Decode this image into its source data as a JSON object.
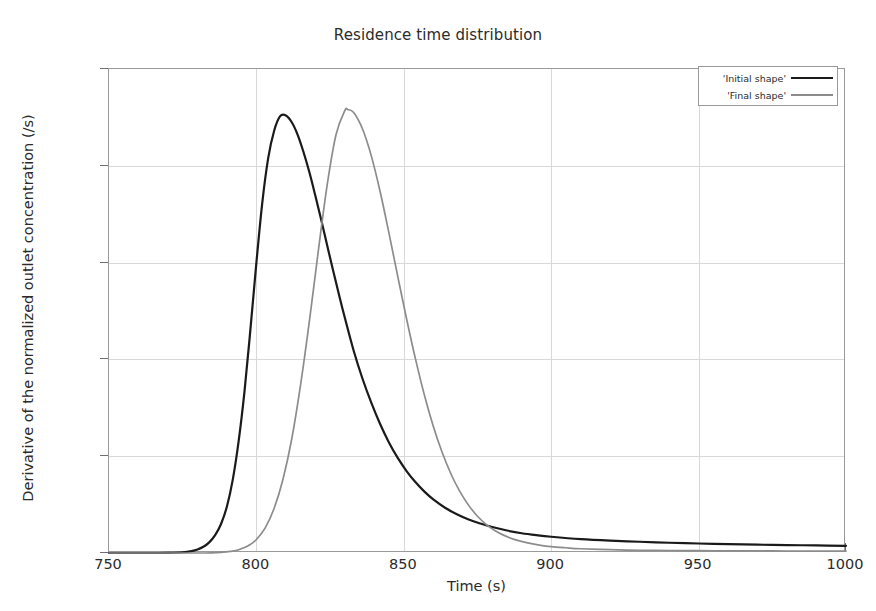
{
  "chart_data": {
    "type": "line",
    "title": "Residence time distribution",
    "xlabel": "Time (s)",
    "ylabel": "Derivative of the normalized outlet concentration (/s)",
    "xlim": [
      750,
      1000
    ],
    "ylim": [
      0,
      0.025
    ],
    "xticks": [
      750,
      800,
      850,
      900,
      950,
      1000
    ],
    "xticklabels": [
      "750",
      "800",
      "850",
      "900",
      "950",
      "1000"
    ],
    "yticks": [
      0,
      0.005,
      0.01,
      0.015,
      0.02,
      0.025
    ],
    "yticklabels": [
      "0",
      "0.005",
      "0.01",
      "0.015",
      "0.02",
      "0.025"
    ],
    "grid": true,
    "legend_position": "top-right",
    "series": [
      {
        "name": "'Initial shape'",
        "color": "#1a1a1a",
        "peak_x": 808,
        "peak_y": 0.0226,
        "x": [
          750,
          755,
          760,
          765,
          770,
          775,
          778,
          780,
          782,
          784,
          786,
          788,
          790,
          792,
          794,
          796,
          798,
          800,
          802,
          804,
          806,
          808,
          810,
          812,
          814,
          816,
          818,
          820,
          822,
          824,
          826,
          828,
          830,
          833,
          836,
          839,
          842,
          845,
          848,
          851,
          854,
          857,
          860,
          864,
          868,
          872,
          876,
          880,
          885,
          890,
          895,
          900,
          910,
          920,
          930,
          940,
          950,
          960,
          970,
          980,
          990,
          1000
        ],
        "y": [
          0.0,
          0.0,
          0.0,
          0.0,
          1e-05,
          4e-05,
          0.0001,
          0.00018,
          0.00032,
          0.00055,
          0.00092,
          0.0015,
          0.0024,
          0.0038,
          0.0058,
          0.0084,
          0.0116,
          0.015,
          0.0181,
          0.0204,
          0.0218,
          0.02255,
          0.0226,
          0.02225,
          0.0216,
          0.0207,
          0.01965,
          0.01845,
          0.0172,
          0.0159,
          0.0146,
          0.01335,
          0.01215,
          0.01045,
          0.009,
          0.00775,
          0.00665,
          0.0057,
          0.0049,
          0.00422,
          0.00365,
          0.00317,
          0.00277,
          0.00234,
          0.002,
          0.00173,
          0.00152,
          0.00134,
          0.00116,
          0.00102,
          0.00092,
          0.00084,
          0.00072,
          0.00064,
          0.00058,
          0.00053,
          0.00049,
          0.00046,
          0.00043,
          0.00041,
          0.00039,
          0.00037
        ]
      },
      {
        "name": "'Final shape'",
        "color": "#8c8c8c",
        "peak_x": 831,
        "peak_y": 0.0229,
        "x": [
          750,
          760,
          770,
          780,
          785,
          788,
          790,
          792,
          794,
          796,
          798,
          800,
          803,
          806,
          809,
          812,
          815,
          818,
          821,
          824,
          827,
          830,
          831,
          833,
          836,
          839,
          842,
          845,
          848,
          851,
          854,
          857,
          860,
          863,
          866,
          869,
          872,
          875,
          878,
          881,
          884,
          888,
          892,
          896,
          900,
          905,
          910,
          920,
          930,
          940,
          950,
          960,
          970,
          980,
          990,
          1000
        ],
        "y": [
          0.0,
          0.0,
          0.0,
          0.0,
          1e-05,
          3e-05,
          6e-05,
          0.0001,
          0.00017,
          0.00028,
          0.00045,
          0.0007,
          0.0013,
          0.0023,
          0.0038,
          0.0059,
          0.0087,
          0.012,
          0.0156,
          0.019,
          0.0216,
          0.02285,
          0.0229,
          0.02275,
          0.0219,
          0.0205,
          0.01865,
          0.0165,
          0.01425,
          0.01205,
          0.01,
          0.00815,
          0.00655,
          0.0052,
          0.00408,
          0.00318,
          0.00246,
          0.0019,
          0.00147,
          0.00115,
          0.00091,
          0.00068,
          0.00052,
          0.00041,
          0.00033,
          0.00027,
          0.00022,
          0.00017,
          0.00014,
          0.00013,
          0.00012,
          0.00011,
          0.00011,
          0.0001,
          0.0001,
          0.0001
        ]
      }
    ]
  },
  "legend": {
    "items": [
      {
        "label": "'Initial shape'",
        "color": "#1a1a1a"
      },
      {
        "label": "'Final shape'",
        "color": "#8c8c8c"
      }
    ]
  }
}
